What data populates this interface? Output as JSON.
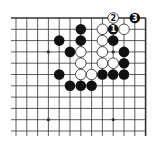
{
  "diagram": {
    "type": "go-board-problem",
    "board_fragment": "top-right corner",
    "grid": {
      "columns": 13,
      "rows": 11,
      "origin_x": 16,
      "origin_y": 18,
      "col_spacing": 10.8,
      "row_spacing": 11.3,
      "edges": [
        "top",
        "right"
      ]
    },
    "colors": {
      "line": "#333333",
      "black_stone": "#111111",
      "white_stone_fill": "#ffffff",
      "white_stone_stroke": "#222222",
      "background": "#ffffff"
    },
    "star_points": [
      {
        "c": 3,
        "r": 3
      },
      {
        "c": 9,
        "r": 3
      },
      {
        "c": 3,
        "r": 9
      },
      {
        "c": 9,
        "r": 9
      }
    ],
    "black_stones": [
      {
        "c": 6,
        "r": 1
      },
      {
        "c": 6,
        "r": 2
      },
      {
        "c": 4,
        "r": 2
      },
      {
        "c": 5,
        "r": 3
      },
      {
        "c": 4,
        "r": 5
      },
      {
        "c": 5,
        "r": 6
      },
      {
        "c": 6,
        "r": 6
      },
      {
        "c": 7,
        "r": 6
      },
      {
        "c": 8,
        "r": 5
      },
      {
        "c": 9,
        "r": 5
      },
      {
        "c": 10,
        "r": 5
      },
      {
        "c": 10,
        "r": 4
      },
      {
        "c": 10,
        "r": 3
      },
      {
        "c": 9,
        "r": 2
      },
      {
        "c": 9,
        "r": 1,
        "label": "1"
      },
      {
        "c": 11,
        "r": 0,
        "label": "3"
      }
    ],
    "white_stones": [
      {
        "c": 8,
        "r": 1
      },
      {
        "c": 8,
        "r": 2
      },
      {
        "c": 8,
        "r": 3
      },
      {
        "c": 8,
        "r": 4
      },
      {
        "c": 6,
        "r": 3
      },
      {
        "c": 6,
        "r": 4
      },
      {
        "c": 6,
        "r": 5
      },
      {
        "c": 7,
        "r": 5
      },
      {
        "c": 9,
        "r": 4
      },
      {
        "c": 10,
        "r": 1
      },
      {
        "c": 9,
        "r": 0,
        "label": "2"
      }
    ]
  }
}
